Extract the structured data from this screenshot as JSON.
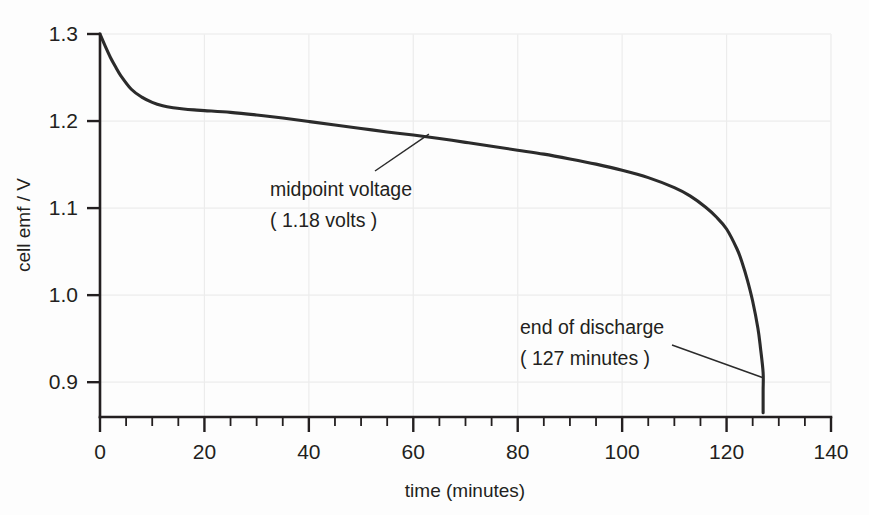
{
  "chart_data": {
    "type": "line",
    "title": "",
    "xlabel": "time (minutes)",
    "ylabel": "cell emf / V",
    "xlim": [
      0,
      140
    ],
    "ylim": [
      0.86,
      1.3
    ],
    "grid": true,
    "legend": "none",
    "x_ticks": [
      0,
      20,
      40,
      60,
      80,
      100,
      120,
      140
    ],
    "x_tick_labels": [
      "0",
      "20",
      "40",
      "60",
      "80",
      "100",
      "120",
      "140"
    ],
    "x_minor_tick_step": 5,
    "y_ticks": [
      0.9,
      1.0,
      1.1,
      1.2,
      1.3
    ],
    "y_tick_labels": [
      "0.9",
      "1.0",
      "1.1",
      "1.2",
      "1.3"
    ],
    "series": [
      {
        "name": "cell discharge curve",
        "color": "#2b2b2b",
        "x": [
          0,
          1,
          2,
          3,
          4,
          6,
          8,
          10,
          12,
          14,
          16,
          18,
          20,
          25,
          30,
          35,
          40,
          45,
          50,
          55,
          60,
          65,
          70,
          75,
          80,
          85,
          90,
          95,
          100,
          105,
          110,
          113,
          116,
          118,
          120,
          122,
          123,
          124,
          125,
          126,
          126.5,
          127,
          127,
          127
        ],
        "y": [
          1.3,
          1.286,
          1.273,
          1.262,
          1.252,
          1.2365,
          1.2275,
          1.2215,
          1.2175,
          1.2152,
          1.2138,
          1.2128,
          1.212,
          1.21,
          1.207,
          1.2035,
          1.1995,
          1.1955,
          1.1915,
          1.1875,
          1.184,
          1.18,
          1.1755,
          1.171,
          1.1665,
          1.162,
          1.1565,
          1.1505,
          1.1435,
          1.135,
          1.1235,
          1.114,
          1.101,
          1.09,
          1.076,
          1.053,
          1.037,
          1.017,
          0.993,
          0.962,
          0.939,
          0.911,
          0.89,
          0.865
        ]
      }
    ],
    "annotations": [
      {
        "id": "midpoint",
        "line1": "midpoint voltage",
        "line2": "( 1.18 volts )",
        "point_x": 63,
        "point_y": 1.185
      },
      {
        "id": "end-of-discharge",
        "line1": "end of discharge",
        "line2": "( 127 minutes )",
        "point_x": 127,
        "point_y": 0.905
      }
    ]
  },
  "axes": {
    "y_title": "cell emf / V",
    "x_title": "time (minutes)"
  },
  "colors": {
    "curve": "#2b2b2b",
    "axis": "#231f20",
    "grid": "#ececec",
    "background": "#fdfdfd"
  }
}
